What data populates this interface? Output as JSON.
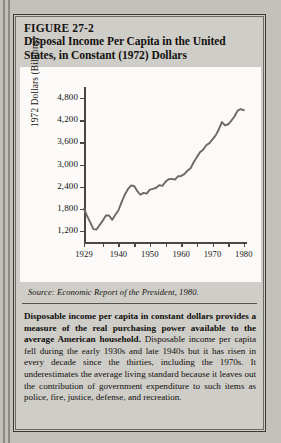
{
  "figure": {
    "number": "FIGURE 27-2",
    "title_line_1": "Disposal Income Per Capita in the United",
    "title_line_2": "States, in Constant (1972) Dollars"
  },
  "source": {
    "prefix": "Source:",
    "text": " Economic Report of the President, 1980."
  },
  "caption": {
    "bold_part": "Disposable income per capita in constant dollars provides a measure of the real purchasing power available to the average American household. ",
    "rest": "Disposable income per capita fell during the early 1930s and late 1940s but it has risen in every decade since the thirties, including the 1970s. It underestimates the average living standard because it leaves out the contribution of government expenditure to such items as police, fire, justice, defense, and recreation."
  },
  "colors": {
    "page_background": "#c3c1bc",
    "box_background": "#cfcdc8",
    "chart_background": "#fbfaf8",
    "ink": "#141310",
    "axis": "#4a4843",
    "series_line": "#6c6a66"
  },
  "chart_data": {
    "type": "line",
    "title": "Disposal Income Per Capita in the United States, in Constant (1972) Dollars",
    "xlabel": "",
    "ylabel": "1972 Dollars (Billions)",
    "xlim": [
      1929,
      1981
    ],
    "ylim": [
      900,
      5100
    ],
    "grid": false,
    "legend": "none",
    "ytick_labels": [
      "1,200",
      "1,800",
      "2,400",
      "3,000",
      "3,600",
      "4,200",
      "4,800"
    ],
    "ytick_values": [
      1200,
      1800,
      2400,
      3000,
      3600,
      4200,
      4800
    ],
    "xtick_values": [
      1929,
      1935,
      1940,
      1945,
      1950,
      1955,
      1960,
      1965,
      1970,
      1975,
      1980
    ],
    "xtick_labels_shown": [
      "1929",
      "1940",
      "1950",
      "1960",
      "1970",
      "1980"
    ],
    "xtick_labels_shown_values": [
      1929,
      1940,
      1950,
      1960,
      1970,
      1980
    ],
    "series": [
      {
        "name": "Disposable income per capita (1972 dollars)",
        "x": [
          1929,
          1930,
          1931,
          1932,
          1933,
          1934,
          1935,
          1936,
          1937,
          1938,
          1939,
          1940,
          1941,
          1942,
          1943,
          1944,
          1945,
          1946,
          1947,
          1948,
          1949,
          1950,
          1951,
          1952,
          1953,
          1954,
          1955,
          1956,
          1957,
          1958,
          1959,
          1960,
          1961,
          1962,
          1963,
          1964,
          1965,
          1966,
          1967,
          1968,
          1969,
          1970,
          1971,
          1972,
          1973,
          1974,
          1975,
          1976,
          1977,
          1978,
          1979,
          1980
        ],
        "values": [
          1800,
          1600,
          1430,
          1250,
          1240,
          1360,
          1480,
          1620,
          1620,
          1500,
          1640,
          1760,
          1980,
          2180,
          2330,
          2430,
          2420,
          2280,
          2180,
          2230,
          2210,
          2320,
          2340,
          2370,
          2440,
          2420,
          2530,
          2600,
          2610,
          2590,
          2680,
          2690,
          2740,
          2830,
          2900,
          3060,
          3200,
          3330,
          3400,
          3520,
          3580,
          3680,
          3790,
          3950,
          4150,
          4060,
          4090,
          4190,
          4300,
          4460,
          4500,
          4470
        ]
      }
    ]
  }
}
